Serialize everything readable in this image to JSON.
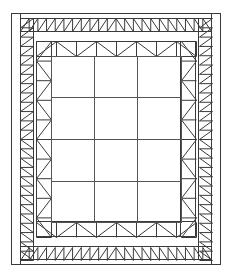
{
  "figure": {
    "name": "nested-rectangular-truss-frame",
    "type": "line-diagram",
    "width": 232,
    "height": 278,
    "background_color": "#ffffff",
    "line_color": "#3a3a3a",
    "accent_line_color": "#555555"
  },
  "geometry": {
    "outer_frame": {
      "x": 11,
      "y": 13,
      "w": 210,
      "h": 252
    },
    "outer_frame_inner": {
      "x": 20,
      "y": 13,
      "w": 192,
      "h": 252
    },
    "zigzag_band": {
      "top": {
        "x1": 20,
        "y1": 18,
        "x2": 212,
        "y2": 31
      },
      "bottom": {
        "x1": 20,
        "y1": 247,
        "x2": 212,
        "y2": 260
      },
      "left": {
        "x1": 20,
        "y1": 18,
        "x2": 33,
        "y2": 260
      },
      "right": {
        "x1": 199,
        "y1": 18,
        "x2": 212,
        "y2": 260
      },
      "teeth_horizontal": 22,
      "teeth_vertical": 26,
      "mirror_at_midspan": true
    },
    "inner_truss_band": {
      "top": {
        "x1": 36,
        "y1": 41,
        "x2": 196,
        "y2": 56
      },
      "bottom": {
        "x1": 36,
        "y1": 222,
        "x2": 196,
        "y2": 237
      },
      "left": {
        "x1": 36,
        "y1": 41,
        "x2": 51,
        "y2": 237
      },
      "right": {
        "x1": 181,
        "y1": 41,
        "x2": 196,
        "y2": 237
      },
      "panel_count_horizontal": 4,
      "panel_count_vertical": 5,
      "top_triangles_point": "up",
      "bottom_triangles_point": "down",
      "left_triangles_point": "left",
      "right_triangles_point": "right"
    },
    "core_grid": {
      "x": 51,
      "y": 56,
      "w": 130,
      "h": 166,
      "columns": 3,
      "rows": 4,
      "vertical_dividers": [
        94,
        137
      ],
      "horizontal_dividers": [
        97,
        139,
        181
      ]
    }
  },
  "labels": {
    "title": "",
    "caption": "",
    "annotations": []
  }
}
